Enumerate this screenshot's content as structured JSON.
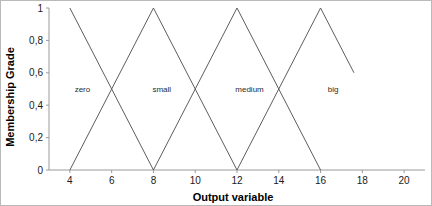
{
  "chart_data": {
    "type": "line",
    "title": "",
    "xlabel": "Output variable",
    "ylabel": "Membership Grade",
    "xlim": [
      3,
      21
    ],
    "ylim": [
      0,
      1
    ],
    "grid": false,
    "legend": "none",
    "x_ticks": [
      "4",
      "6",
      "8",
      "10",
      "12",
      "14",
      "16",
      "18",
      "20"
    ],
    "x_tick_values": [
      4,
      6,
      8,
      10,
      12,
      14,
      16,
      18,
      20
    ],
    "y_ticks": [
      "0",
      "0,2",
      "0,4",
      "0,6",
      "0,8",
      "1"
    ],
    "y_tick_values": [
      0,
      0.2,
      0.4,
      0.6,
      0.8,
      1
    ],
    "series": [
      {
        "name": "zero",
        "label": "zero",
        "label_x": 4.6,
        "label_y": 0.5,
        "points": [
          [
            4,
            1
          ],
          [
            8,
            0
          ]
        ]
      },
      {
        "name": "small",
        "label": "small",
        "label_x": 8.4,
        "label_y": 0.5,
        "points": [
          [
            4,
            0
          ],
          [
            8,
            1
          ],
          [
            12,
            0
          ]
        ]
      },
      {
        "name": "medium",
        "label": "medium",
        "label_x": 12.6,
        "label_y": 0.5,
        "points": [
          [
            8,
            0
          ],
          [
            12,
            1
          ],
          [
            16,
            0
          ]
        ]
      },
      {
        "name": "big",
        "label": "big",
        "label_x": 16.6,
        "label_y": 0.5,
        "points": [
          [
            12,
            0
          ],
          [
            16,
            1
          ],
          [
            17.6,
            0.6
          ]
        ]
      }
    ]
  }
}
